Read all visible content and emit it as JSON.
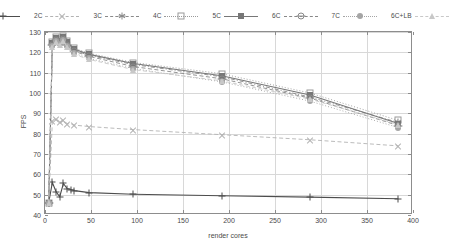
{
  "chart_data": {
    "type": "line",
    "title": "",
    "xlabel": "render cores",
    "ylabel": "FPS",
    "xlim": [
      0,
      400
    ],
    "ylim": [
      40,
      130
    ],
    "xticks": [
      0,
      50,
      100,
      150,
      200,
      250,
      300,
      350,
      400
    ],
    "yticks": [
      40,
      50,
      60,
      70,
      80,
      90,
      100,
      110,
      120,
      130
    ],
    "grid": true,
    "legend_position": "top-outside",
    "series": [
      {
        "name": "1C",
        "color": "#4d4d4d",
        "dash": "solid",
        "marker": "plus",
        "x": [
          4,
          8,
          12,
          16,
          20,
          24,
          28,
          32,
          48,
          96,
          192,
          288,
          384
        ],
        "y": [
          46.0,
          56.0,
          51.5,
          49.0,
          55.5,
          53.0,
          52.5,
          52.0,
          51.0,
          50.2,
          49.5,
          48.8,
          48.0
        ]
      },
      {
        "name": "2C",
        "color": "#b3b3b3",
        "dash": "dashed",
        "marker": "cross",
        "x": [
          4,
          8,
          12,
          16,
          20,
          24,
          32,
          48,
          96,
          192,
          288,
          384
        ],
        "y": [
          46.0,
          86.0,
          87.0,
          85.5,
          86.5,
          85.0,
          84.2,
          83.5,
          82.0,
          79.5,
          77.0,
          74.0
        ]
      },
      {
        "name": "3C",
        "color": "#8a8a8a",
        "dash": "dashdot",
        "marker": "star",
        "x": [
          4,
          8,
          12,
          16,
          20,
          24,
          32,
          48,
          96,
          192,
          288,
          384
        ],
        "y": [
          46.0,
          124.0,
          126.5,
          125.0,
          127.0,
          124.5,
          121.0,
          118.5,
          114.0,
          108.0,
          98.0,
          85.5
        ]
      },
      {
        "name": "4C",
        "color": "#9a9a9a",
        "dash": "dotted",
        "marker": "square-open",
        "x": [
          4,
          8,
          12,
          16,
          20,
          24,
          32,
          48,
          96,
          192,
          288,
          384
        ],
        "y": [
          46.0,
          125.0,
          127.5,
          126.0,
          128.0,
          125.5,
          122.0,
          119.5,
          115.0,
          109.5,
          100.0,
          86.5
        ]
      },
      {
        "name": "5C",
        "color": "#777777",
        "dash": "solid",
        "marker": "square-fill",
        "x": [
          4,
          8,
          12,
          16,
          20,
          24,
          32,
          48,
          96,
          192,
          288,
          384
        ],
        "y": [
          46.0,
          124.5,
          127.0,
          125.5,
          127.5,
          125.0,
          121.5,
          119.0,
          114.5,
          108.5,
          99.0,
          85.0
        ]
      },
      {
        "name": "6C",
        "color": "#888888",
        "dash": "dashed",
        "marker": "circle-open",
        "x": [
          4,
          8,
          12,
          16,
          20,
          24,
          32,
          48,
          96,
          192,
          288,
          384
        ],
        "y": [
          46.0,
          123.5,
          126.0,
          124.5,
          126.5,
          123.5,
          120.5,
          118.0,
          113.0,
          107.0,
          97.5,
          84.0
        ]
      },
      {
        "name": "7C",
        "color": "#a5a5a5",
        "dash": "dotted",
        "marker": "circle-fill",
        "x": [
          4,
          8,
          12,
          16,
          20,
          24,
          32,
          48,
          96,
          192,
          288,
          384
        ],
        "y": [
          46.0,
          123.0,
          125.5,
          124.0,
          126.0,
          123.0,
          119.5,
          117.0,
          112.0,
          105.5,
          96.0,
          83.0
        ]
      },
      {
        "name": "6C+LB",
        "color": "#c8c8c8",
        "dash": "dashed",
        "marker": "triangle",
        "x": [
          4,
          8,
          12,
          16,
          20,
          24,
          32,
          48,
          96,
          192,
          288,
          384
        ],
        "y": [
          46.0,
          122.5,
          125.0,
          123.5,
          125.5,
          122.5,
          119.0,
          116.5,
          111.5,
          106.0,
          97.0,
          84.5
        ]
      }
    ]
  },
  "legend": {
    "items": [
      {
        "label": "1C",
        "marker_name": "plus-marker"
      },
      {
        "label": "2C",
        "marker_name": "cross-marker"
      },
      {
        "label": "3C",
        "marker_name": "star-marker"
      },
      {
        "label": "4C",
        "marker_name": "open-square-marker"
      },
      {
        "label": "5C",
        "marker_name": "filled-square-marker"
      },
      {
        "label": "6C",
        "marker_name": "open-circle-marker"
      },
      {
        "label": "7C",
        "marker_name": "filled-circle-marker"
      },
      {
        "label": "6C+LB",
        "marker_name": "triangle-marker"
      }
    ]
  },
  "axes": {
    "y_label": "FPS",
    "x_label": "render cores",
    "y_ticks": [
      "40",
      "50",
      "60",
      "70",
      "80",
      "90",
      "100",
      "110",
      "120",
      "130"
    ],
    "x_ticks": [
      "0",
      "50",
      "100",
      "150",
      "200",
      "250",
      "300",
      "350",
      "400"
    ]
  },
  "colors": {
    "frame": "#8d8d8d",
    "grid": "#d8d8d8",
    "text": "#4a4a4a",
    "background": "#ffffff"
  }
}
